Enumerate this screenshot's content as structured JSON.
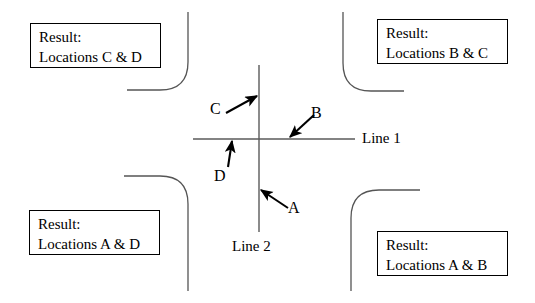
{
  "diagram": {
    "canvas": {
      "width": 535,
      "height": 303,
      "background": "#ffffff"
    },
    "stroke_color": "#000000",
    "curve_color": "#555555",
    "axis_color": "#5a5a5a"
  },
  "axes": {
    "horizontal": {
      "label": "Line 1",
      "label_x": 362,
      "label_y": 130,
      "x1": 193,
      "y1": 139,
      "x2": 355,
      "y2": 139
    },
    "vertical": {
      "label": "Line 2",
      "label_x": 232,
      "label_y": 238,
      "x1": 259,
      "y1": 65,
      "x2": 259,
      "y2": 232
    },
    "center": {
      "x": 259,
      "y": 139
    }
  },
  "arrows": [
    {
      "id": "arrow-a",
      "label": "A",
      "label_x": 288,
      "label_y": 199,
      "tail_x": 288,
      "tail_y": 208,
      "tip_x": 261,
      "tip_y": 190,
      "points_to": "Line 2 below intersection"
    },
    {
      "id": "arrow-b",
      "label": "B",
      "label_x": 311,
      "label_y": 104,
      "tail_x": 314,
      "tail_y": 115,
      "tip_x": 290,
      "tip_y": 137,
      "points_to": "Line 1 right of intersection"
    },
    {
      "id": "arrow-c",
      "label": "C",
      "label_x": 210,
      "label_y": 100,
      "tail_x": 226,
      "tail_y": 113,
      "tip_x": 257,
      "tip_y": 96,
      "points_to": "Line 2 above intersection"
    },
    {
      "id": "arrow-d",
      "label": "D",
      "label_x": 214,
      "label_y": 167,
      "tail_x": 228,
      "tail_y": 167,
      "tip_x": 232,
      "tip_y": 141,
      "points_to": "Line 1 left of intersection"
    }
  ],
  "result_boxes": [
    {
      "id": "result-top-left",
      "quadrant": "top-left",
      "line1": "Result:",
      "line2": "Locations C & D",
      "x": 30,
      "y": 23,
      "width": 131,
      "height": 45
    },
    {
      "id": "result-top-right",
      "quadrant": "top-right",
      "line1": "Result:",
      "line2": "Locations B & C",
      "x": 377,
      "y": 19,
      "width": 131,
      "height": 45
    },
    {
      "id": "result-bottom-left",
      "quadrant": "bottom-left",
      "line1": "Result:",
      "line2": "Locations A & D",
      "x": 29,
      "y": 210,
      "width": 131,
      "height": 45
    },
    {
      "id": "result-bottom-right",
      "quadrant": "bottom-right",
      "line1": "Result:",
      "line2": "Locations A & B",
      "x": 377,
      "y": 231,
      "width": 131,
      "height": 45
    }
  ],
  "corner_curves": [
    {
      "id": "curve-top-left",
      "path": "M 188 12 L 188 62 Q 188 90 160 90 L 127 90"
    },
    {
      "id": "curve-top-right",
      "path": "M 343 12 L 343 63 Q 343 91 371 91 L 404 91"
    },
    {
      "id": "curve-bottom-left",
      "path": "M 124 176 L 160 176 Q 188 176 188 204 L 188 291"
    },
    {
      "id": "curve-bottom-right",
      "path": "M 351 291 L 351 218 Q 351 190 379 190 L 420 190"
    }
  ]
}
